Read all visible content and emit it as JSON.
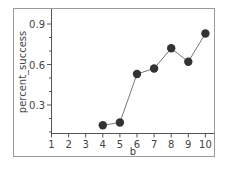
{
  "chart_data": {
    "type": "line",
    "title": "",
    "xlabel": "b",
    "ylabel": "percent_success",
    "x": [
      4,
      5,
      6,
      7,
      8,
      9,
      10
    ],
    "series": [
      {
        "name": "percent_success",
        "values": [
          0.15,
          0.17,
          0.53,
          0.57,
          0.72,
          0.62,
          0.83
        ]
      }
    ],
    "xticks": [
      1,
      2,
      3,
      4,
      5,
      6,
      7,
      8,
      9,
      10
    ],
    "yticks": [
      "0.3",
      "0.6",
      "0.9"
    ],
    "xlim": [
      1,
      10
    ],
    "ylim": [
      0.06,
      1.0
    ],
    "grid": false,
    "legend": "none",
    "colors": {
      "marker": "#333333",
      "line": "#777777",
      "frame": "#888888"
    }
  }
}
